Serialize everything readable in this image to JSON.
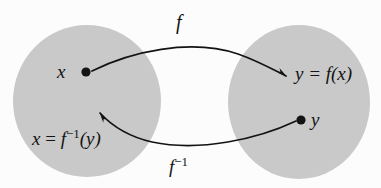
{
  "diagram": {
    "canvas": {
      "width": 381,
      "height": 188
    },
    "colors": {
      "background": "#fcfcfc",
      "set_fill": "#c9c9c9",
      "stroke": "#131313",
      "text": "#131313"
    },
    "sets": [
      {
        "name": "domain-set",
        "cx": 87,
        "cy": 101,
        "rx": 74,
        "ry": 76
      },
      {
        "name": "codomain-set",
        "cx": 299,
        "cy": 102,
        "rx": 71,
        "ry": 77
      }
    ],
    "points": [
      {
        "name": "x-point",
        "cx": 86,
        "cy": 72,
        "r": 4.5,
        "label": "x"
      },
      {
        "name": "y-point",
        "cx": 301,
        "cy": 120,
        "r": 4.5,
        "label": "y"
      }
    ],
    "labels": {
      "forward_map": "f",
      "inverse_map_f": "f",
      "inverse_map_exp": "−1",
      "image_lhs": "y = f(x)",
      "preimage_x": "x",
      "preimage_eq": " = ",
      "preimage_f": "f",
      "preimage_exp": "−1",
      "preimage_arg": "(y)",
      "point_x": "x",
      "point_y": "y"
    },
    "arrows": [
      {
        "name": "forward-arrow",
        "from": "x-point",
        "to": "y = f(x)",
        "label": "f",
        "path": "M 92 71 C 130 52, 190 38, 238 54 C 258 61, 275 70, 288 77"
      },
      {
        "name": "inverse-arrow",
        "from": "y-point",
        "to": "x = f^-1(y)",
        "label": "f^-1",
        "path": "M 296 121 C 258 139, 200 152, 152 142 C 128 136, 110 124, 99 112"
      }
    ]
  }
}
